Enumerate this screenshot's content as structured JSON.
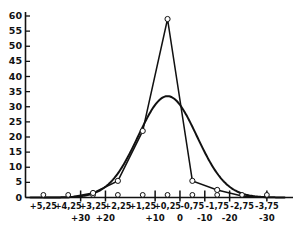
{
  "chart_data": {
    "type": "line",
    "title": "",
    "subtitle": "",
    "xlabel": "",
    "ylabel": "",
    "grid": false,
    "legend": "none",
    "ylim": [
      0,
      60
    ],
    "ytick_step": 5,
    "yticks": [
      "0",
      "5",
      "10",
      "15",
      "20",
      "25",
      "30",
      "35",
      "40",
      "45",
      "50",
      "55",
      "60"
    ],
    "x_axis_rows": 2,
    "categories": [
      "+5,25",
      "+4,25",
      "+3,25",
      "+2,25",
      "+1,25",
      "+0,25",
      "-0,75",
      "-1,75",
      "-2,75",
      "-3,75"
    ],
    "xticks_primary": [
      "+5,25",
      "+4,25",
      "+3,25",
      "+2,25",
      "+1,25",
      "+0,25",
      "-0,75",
      "-1,75",
      "-2,75",
      "-3,75"
    ],
    "xticks_secondary": [
      "+30",
      "+20",
      "+10",
      "0",
      "-10",
      "-20",
      "-30"
    ],
    "xticks_secondary_positions": [
      1.5,
      2.5,
      4.5,
      5.5,
      6.5,
      7.5,
      9.0
    ],
    "series": [
      {
        "name": "empirical-polygon",
        "style": "line-with-circle-markers",
        "categories": [
          "+5,25",
          "+4,25",
          "+3,25",
          "+2,25",
          "+1,25",
          "+0,25",
          "-0,75",
          "-1,75",
          "-2,75",
          "-3,75"
        ],
        "values": [
          0,
          0,
          1.5,
          5.5,
          22,
          59,
          5.5,
          2.5,
          0.5,
          0
        ]
      },
      {
        "name": "theoretical-gaussian",
        "style": "smooth-curve",
        "peak_value": 33.5,
        "peak_category": "+0,25",
        "values": [
          0,
          0.4,
          2.0,
          8.0,
          21.0,
          33.5,
          21.5,
          8.5,
          2.2,
          0.4
        ]
      }
    ],
    "axis_color": "#111111",
    "line_color": "#111111",
    "marker_fill": "#ffffff",
    "background": "#ffffff"
  }
}
